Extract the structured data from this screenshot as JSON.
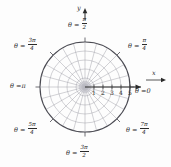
{
  "figure": {
    "kind": "polar-coordinate-grid",
    "background_color": "#fdfdfd",
    "grid_color": "#9a9aa3",
    "outer_circle_color": "#4a4a52",
    "axis_color": "#2b2b2b",
    "center": {
      "x": 85,
      "y": 87
    },
    "outer_radius_px": 45,
    "rings": [
      1,
      2,
      3,
      4,
      5
    ],
    "radial_spokes": 24,
    "radial_step_label": "pi/12"
  },
  "axes": {
    "x_label": "x",
    "y_label": "y",
    "x_axis_ticks": [
      "1",
      "2",
      "3",
      "4",
      "5"
    ]
  },
  "theta_labels": [
    {
      "id": "theta-0",
      "eq": "θ =",
      "value": "0",
      "num": "",
      "den": "",
      "fraction": false
    },
    {
      "id": "theta-pi-4",
      "eq": "θ =",
      "value": "",
      "num": "π",
      "den": "4",
      "fraction": true
    },
    {
      "id": "theta-pi-2",
      "eq": "θ =",
      "value": "",
      "num": "π",
      "den": "2",
      "fraction": true
    },
    {
      "id": "theta-3pi-4",
      "eq": "θ =",
      "value": "",
      "num": "3π",
      "den": "4",
      "fraction": true
    },
    {
      "id": "theta-pi",
      "eq": "θ =",
      "value": "π",
      "num": "",
      "den": "",
      "fraction": false
    },
    {
      "id": "theta-5pi-4",
      "eq": "θ =",
      "value": "",
      "num": "5π",
      "den": "4",
      "fraction": true
    },
    {
      "id": "theta-3pi-2",
      "eq": "θ =",
      "value": "",
      "num": "3π",
      "den": "2",
      "fraction": true
    },
    {
      "id": "theta-7pi-4",
      "eq": "θ =",
      "value": "",
      "num": "7π",
      "den": "4",
      "fraction": true
    }
  ]
}
